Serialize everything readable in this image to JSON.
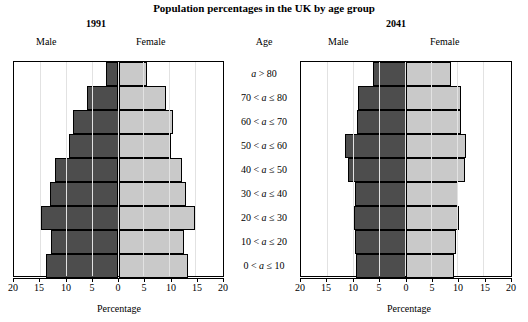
{
  "title": "Population percentages in the UK by age group",
  "axis_title": "Percentage",
  "age_header": "Age",
  "labels": {
    "male": "Male",
    "female": "Female"
  },
  "tick_values": [
    "20",
    "15",
    "10",
    "5",
    "0",
    "5",
    "10",
    "15",
    "20"
  ],
  "colors": {
    "male_bar": "#4d4d4d",
    "female_bar": "#c9c9c9",
    "border": "#000000",
    "gridline": "#e2e2e2",
    "background": "#ffffff"
  },
  "age_groups": [
    "a > 80",
    "70 < a ≤ 80",
    "60 < a ≤ 70",
    "50 < a ≤ 60",
    "40 < a ≤ 50",
    "30 < a ≤ 40",
    "20 < a ≤ 30",
    "10 < a ≤ 20",
    "0 < a ≤ 10"
  ],
  "panels": [
    {
      "id": "panel1991",
      "year": "1991"
    },
    {
      "id": "panel2041",
      "year": "2041"
    }
  ],
  "chart_data": [
    {
      "type": "bar",
      "title": "1991",
      "subtype": "population-pyramid",
      "xlabel": "Percentage",
      "ylabel": "Age",
      "xlim": [
        -20,
        20
      ],
      "xticks": [
        20,
        15,
        10,
        5,
        0,
        5,
        10,
        15,
        20
      ],
      "grid": true,
      "categories": [
        "a > 80",
        "70 < a ≤ 80",
        "60 < a ≤ 70",
        "50 < a ≤ 60",
        "40 < a ≤ 50",
        "30 < a ≤ 40",
        "20 < a ≤ 30",
        "10 < a ≤ 20",
        "0 < a ≤ 10"
      ],
      "series": [
        {
          "name": "Male",
          "side": "left",
          "values": [
            2.3,
            6.0,
            8.8,
            9.5,
            12.1,
            13.1,
            14.9,
            12.9,
            13.8
          ]
        },
        {
          "name": "Female",
          "side": "right",
          "values": [
            5.4,
            8.9,
            10.3,
            10.0,
            12.0,
            12.8,
            14.6,
            12.4,
            13.2
          ]
        }
      ]
    },
    {
      "type": "bar",
      "title": "2041",
      "subtype": "population-pyramid",
      "xlabel": "Percentage",
      "ylabel": "Age",
      "xlim": [
        -20,
        20
      ],
      "xticks": [
        20,
        15,
        10,
        5,
        0,
        5,
        10,
        15,
        20
      ],
      "grid": true,
      "categories": [
        "a > 80",
        "70 < a ≤ 80",
        "60 < a ≤ 70",
        "50 < a ≤ 60",
        "40 < a ≤ 50",
        "30 < a ≤ 40",
        "20 < a ≤ 30",
        "10 < a ≤ 20",
        "0 < a ≤ 10"
      ],
      "series": [
        {
          "name": "Male",
          "side": "left",
          "values": [
            6.3,
            9.2,
            9.4,
            11.6,
            11.0,
            9.7,
            10.0,
            9.8,
            9.6
          ]
        },
        {
          "name": "Female",
          "side": "right",
          "values": [
            8.6,
            10.4,
            10.4,
            11.4,
            11.3,
            9.9,
            10.0,
            9.5,
            9.2
          ]
        }
      ]
    }
  ]
}
